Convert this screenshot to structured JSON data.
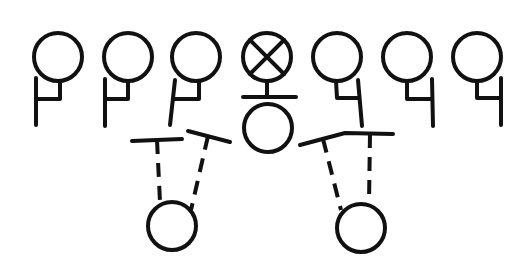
{
  "diagram": {
    "type": "football-play",
    "colors": {
      "stroke": "#111111",
      "background": "#ffffff"
    },
    "offensive_line": [
      {
        "id": "LE",
        "cx": 58,
        "cy": 57,
        "symbol": "circle",
        "stance": "left"
      },
      {
        "id": "LT",
        "cx": 128,
        "cy": 57,
        "symbol": "circle",
        "stance": "left"
      },
      {
        "id": "LG",
        "cx": 196,
        "cy": 57,
        "symbol": "circle",
        "stance": "left"
      },
      {
        "id": "C",
        "cx": 267,
        "cy": 57,
        "symbol": "circle-x"
      },
      {
        "id": "RG",
        "cx": 337,
        "cy": 57,
        "symbol": "circle",
        "stance": "right"
      },
      {
        "id": "RT",
        "cx": 407,
        "cy": 57,
        "symbol": "circle",
        "stance": "right"
      },
      {
        "id": "RE",
        "cx": 477,
        "cy": 57,
        "symbol": "circle",
        "stance": "right"
      }
    ],
    "backfield": [
      {
        "id": "QB",
        "cx": 268,
        "cy": 128,
        "symbol": "circle"
      },
      {
        "id": "LB_back",
        "cx": 172,
        "cy": 226,
        "symbol": "circle"
      },
      {
        "id": "RB_back",
        "cx": 361,
        "cy": 228,
        "symbol": "circle"
      }
    ],
    "blocks": [
      {
        "from": "LB_back",
        "bar": [
          [
            132,
            141
          ],
          [
            182,
            139
          ]
        ],
        "stem_top": [
          157,
          140
        ],
        "stem_bottom": [
          160,
          200
        ]
      },
      {
        "from": "LB_back",
        "bar": [
          [
            188,
            131
          ],
          [
            230,
            141
          ]
        ],
        "stem_top": [
          209,
          136
        ],
        "stem_bottom": [
          191,
          208
        ]
      },
      {
        "from": "RB_back",
        "bar": [
          [
            300,
            145
          ],
          [
            345,
            131
          ]
        ],
        "stem_top": [
          323,
          138
        ],
        "stem_bottom": [
          341,
          208
        ]
      },
      {
        "from": "RB_back",
        "bar": [
          [
            345,
            131
          ],
          [
            393,
            134
          ]
        ],
        "stem_top": [
          370,
          133
        ],
        "stem_bottom": [
          369,
          200
        ]
      }
    ]
  }
}
